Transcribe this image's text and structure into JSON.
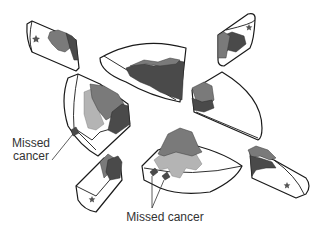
{
  "diagram": {
    "labels": {
      "missed_cancer_left": "Missed\ncancer",
      "missed_cancer_left_line1": "Missed",
      "missed_cancer_left_line2": "cancer",
      "missed_cancer_bottom": "Missed cancer"
    },
    "colors": {
      "outline": "#1a1a1a",
      "tissue": "#ffffff",
      "tumor_dark": "#4a4a4a",
      "tumor_mid": "#7a7a7a",
      "tumor_light": "#b4b4b4",
      "label_text": "#333333"
    },
    "pieces": [
      {
        "id": "top-left-margin",
        "has_star": true
      },
      {
        "id": "top-center-wedge",
        "has_star": false
      },
      {
        "id": "top-right-margin",
        "has_star": true
      },
      {
        "id": "left-large-wedge",
        "has_star": false,
        "has_missed_cancer": true
      },
      {
        "id": "right-wedge",
        "has_star": false
      },
      {
        "id": "bottom-center-wedge",
        "has_star": false,
        "has_missed_cancer": true
      },
      {
        "id": "bottom-left-margin",
        "has_star": true
      },
      {
        "id": "bottom-right-margin",
        "has_star": true
      }
    ]
  }
}
